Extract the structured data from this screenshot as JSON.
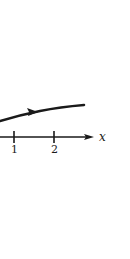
{
  "diagram": {
    "axis": {
      "label": "x",
      "ticks": [
        {
          "label": "1",
          "x": 14
        },
        {
          "label": "2",
          "x": 54
        }
      ]
    },
    "curve": {
      "description": "trajectory curve with direction arrow pointing right",
      "direction": "right"
    },
    "colors": {
      "ink": "#1a1a1a",
      "background": "#ffffff"
    }
  }
}
